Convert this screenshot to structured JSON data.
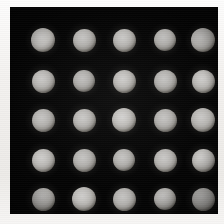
{
  "figure": {
    "width": 224,
    "height": 224,
    "background_color": "#f2f0ed",
    "panel_color": "#040404",
    "spot_color": "#e6e4e1",
    "caption": ""
  },
  "panel": {
    "left": 10,
    "top": 7,
    "width": 208,
    "height": 207
  },
  "chart_data": {
    "type": "heatmap",
    "title": "",
    "subtitle": "",
    "xlabel": "",
    "ylabel": "",
    "grid": false,
    "legend": "none",
    "rows": 5,
    "cols": 5,
    "spot_count": 25,
    "spot_diameter": 23,
    "xlim": [
      0,
      208
    ],
    "ylim": [
      0,
      207
    ],
    "x_centers": [
      33,
      74,
      114,
      155,
      193
    ],
    "y_centers": [
      33,
      74,
      113,
      153,
      192
    ],
    "tick_labels_x": [
      "",
      "",
      "",
      "",
      ""
    ],
    "tick_labels_y": [
      "",
      "",
      "",
      "",
      ""
    ],
    "values": [
      [
        0.92,
        0.9,
        0.91,
        0.89,
        0.93
      ],
      [
        0.91,
        0.89,
        0.92,
        0.9,
        0.92
      ],
      [
        0.9,
        0.91,
        0.93,
        0.9,
        0.91
      ],
      [
        0.92,
        0.9,
        0.9,
        0.91,
        0.92
      ],
      [
        0.91,
        0.92,
        0.9,
        0.89,
        0.91
      ]
    ],
    "spots": [
      {
        "id": "spot-r1-c1",
        "row": 1,
        "col": 1,
        "cx": 33,
        "cy": 33,
        "d": 24,
        "intensity": 0.92
      },
      {
        "id": "spot-r1-c2",
        "row": 1,
        "col": 2,
        "cx": 74,
        "cy": 33,
        "d": 23,
        "intensity": 0.9
      },
      {
        "id": "spot-r1-c3",
        "row": 1,
        "col": 3,
        "cx": 114,
        "cy": 33,
        "d": 23,
        "intensity": 0.91
      },
      {
        "id": "spot-r1-c4",
        "row": 1,
        "col": 4,
        "cx": 155,
        "cy": 33,
        "d": 22,
        "intensity": 0.89
      },
      {
        "id": "spot-r1-c5",
        "row": 1,
        "col": 5,
        "cx": 193,
        "cy": 33,
        "d": 24,
        "intensity": 0.93
      },
      {
        "id": "spot-r2-c1",
        "row": 2,
        "col": 1,
        "cx": 33,
        "cy": 74,
        "d": 23,
        "intensity": 0.91
      },
      {
        "id": "spot-r2-c2",
        "row": 2,
        "col": 2,
        "cx": 74,
        "cy": 74,
        "d": 22,
        "intensity": 0.89
      },
      {
        "id": "spot-r2-c3",
        "row": 2,
        "col": 3,
        "cx": 114,
        "cy": 74,
        "d": 23,
        "intensity": 0.92
      },
      {
        "id": "spot-r2-c4",
        "row": 2,
        "col": 4,
        "cx": 155,
        "cy": 74,
        "d": 23,
        "intensity": 0.9
      },
      {
        "id": "spot-r2-c5",
        "row": 2,
        "col": 5,
        "cx": 193,
        "cy": 74,
        "d": 23,
        "intensity": 0.92
      },
      {
        "id": "spot-r3-c1",
        "row": 3,
        "col": 1,
        "cx": 33,
        "cy": 113,
        "d": 23,
        "intensity": 0.9
      },
      {
        "id": "spot-r3-c2",
        "row": 3,
        "col": 2,
        "cx": 74,
        "cy": 113,
        "d": 23,
        "intensity": 0.91
      },
      {
        "id": "spot-r3-c3",
        "row": 3,
        "col": 3,
        "cx": 114,
        "cy": 113,
        "d": 24,
        "intensity": 0.93
      },
      {
        "id": "spot-r3-c4",
        "row": 3,
        "col": 4,
        "cx": 155,
        "cy": 113,
        "d": 23,
        "intensity": 0.9
      },
      {
        "id": "spot-r3-c5",
        "row": 3,
        "col": 5,
        "cx": 193,
        "cy": 113,
        "d": 24,
        "intensity": 0.91
      },
      {
        "id": "spot-r4-c1",
        "row": 4,
        "col": 1,
        "cx": 33,
        "cy": 153,
        "d": 23,
        "intensity": 0.92
      },
      {
        "id": "spot-r4-c2",
        "row": 4,
        "col": 2,
        "cx": 74,
        "cy": 153,
        "d": 23,
        "intensity": 0.9
      },
      {
        "id": "spot-r4-c3",
        "row": 4,
        "col": 3,
        "cx": 114,
        "cy": 153,
        "d": 22,
        "intensity": 0.9
      },
      {
        "id": "spot-r4-c4",
        "row": 4,
        "col": 4,
        "cx": 155,
        "cy": 153,
        "d": 23,
        "intensity": 0.91
      },
      {
        "id": "spot-r4-c5",
        "row": 4,
        "col": 5,
        "cx": 193,
        "cy": 153,
        "d": 23,
        "intensity": 0.92
      },
      {
        "id": "spot-r5-c1",
        "row": 5,
        "col": 1,
        "cx": 33,
        "cy": 192,
        "d": 23,
        "intensity": 0.91
      },
      {
        "id": "spot-r5-c2",
        "row": 5,
        "col": 2,
        "cx": 74,
        "cy": 192,
        "d": 24,
        "intensity": 0.92
      },
      {
        "id": "spot-r5-c3",
        "row": 5,
        "col": 3,
        "cx": 114,
        "cy": 192,
        "d": 23,
        "intensity": 0.9
      },
      {
        "id": "spot-r5-c4",
        "row": 5,
        "col": 4,
        "cx": 155,
        "cy": 192,
        "d": 22,
        "intensity": 0.89
      },
      {
        "id": "spot-r5-c5",
        "row": 5,
        "col": 5,
        "cx": 193,
        "cy": 192,
        "d": 23,
        "intensity": 0.91
      }
    ]
  }
}
